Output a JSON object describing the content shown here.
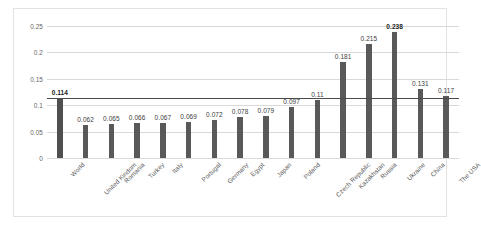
{
  "chart_data": {
    "type": "bar",
    "title": "",
    "subtitle": "",
    "xlabel": "",
    "ylabel": "",
    "categories": [
      "World",
      "United Kindom",
      "Romania",
      "Turkey",
      "Italy",
      "Portugal",
      "Germany",
      "Egypt",
      "Japan",
      "Poland",
      "Czech Republic",
      "Kazakhstan",
      "Russia",
      "Ukraine",
      "China",
      "The USA"
    ],
    "values": [
      0.114,
      0.062,
      0.065,
      0.066,
      0.067,
      0.069,
      0.072,
      0.078,
      0.079,
      0.097,
      0.11,
      0.181,
      0.215,
      0.238,
      0.131,
      0.117
    ],
    "data_labels": [
      "0.114",
      "0.062",
      "0.065",
      "0.066",
      "0.067",
      "0.069",
      "0.072",
      "0.078",
      "0.079",
      "0.097",
      "0.11",
      "0.181",
      "0.215",
      "0.238",
      "0.131",
      "0.117"
    ],
    "bold_labels": [
      "0.114",
      "0.238"
    ],
    "ylim": [
      0,
      0.25
    ],
    "ytick_values": [
      0,
      0.05,
      0.1,
      0.15,
      0.2,
      0.25
    ],
    "ytick_labels": [
      "0",
      "0.05",
      "0.1",
      "0.15",
      "0.2",
      "0.25"
    ],
    "grid": true,
    "legend": false,
    "reference_line": {
      "value": 0.114,
      "label": "0.114",
      "color": "#4a4a4a"
    },
    "colors": {
      "bar": "#595959",
      "highlight_bar": "#4f4f4f",
      "gridline": "#d9d9d9",
      "reference_line": "#4a4a4a",
      "background": "#ffffff",
      "frame_border": "#e2e2e2",
      "tick_text": "#666666",
      "category_text": "#595959",
      "label_text": "#3d3d3d"
    }
  }
}
